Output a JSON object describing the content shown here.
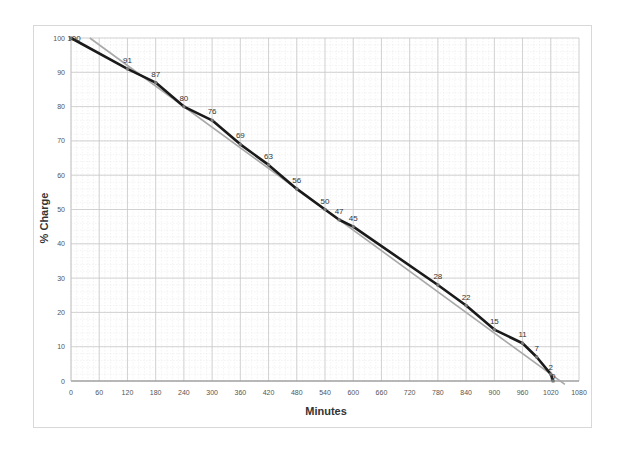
{
  "chart_data": {
    "type": "line",
    "title": "",
    "xlabel": "Minutes",
    "ylabel": "% Charge",
    "xlim": [
      0,
      1080
    ],
    "ylim": [
      0,
      100
    ],
    "grid": true,
    "legend": null,
    "x_ticks": [
      0,
      60,
      120,
      180,
      240,
      300,
      360,
      420,
      480,
      540,
      600,
      660,
      720,
      780,
      840,
      900,
      960,
      1020,
      1080
    ],
    "y_ticks": [
      0,
      10,
      20,
      30,
      40,
      50,
      60,
      70,
      80,
      90,
      100
    ],
    "series": [
      {
        "name": "Battery charge",
        "color": "#1a1a1a",
        "x": [
          0,
          120,
          180,
          240,
          300,
          360,
          420,
          480,
          540,
          570,
          600,
          780,
          840,
          900,
          960,
          990,
          1020,
          1025
        ],
        "values": [
          100,
          91,
          87,
          80,
          76,
          69,
          63,
          56,
          50,
          47,
          45,
          28,
          22,
          15,
          11,
          7,
          2,
          0
        ],
        "labels": [
          "100",
          "91",
          "87",
          "80",
          "76",
          "69",
          "63",
          "56",
          "50",
          "47",
          "45",
          "28",
          "22",
          "15",
          "11",
          "7",
          "2",
          "0"
        ]
      },
      {
        "name": "Linear trend",
        "color": "#a8a8a8",
        "x": [
          40,
          1050
        ],
        "values": [
          100,
          -1
        ]
      }
    ]
  },
  "colors": {
    "grid_major": "#c8c8c8",
    "grid_minor": "#e6e6e6",
    "series_main": "#1a1a1a",
    "trendline": "#a8a8a8",
    "frame": "#d8d8d8"
  }
}
